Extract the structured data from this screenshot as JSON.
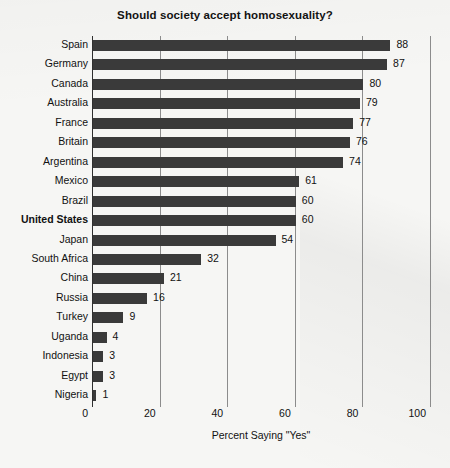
{
  "chart_data": {
    "type": "bar",
    "orientation": "horizontal",
    "title": "Should society accept homosexuality?",
    "xlabel": "Percent Saying \"Yes\"",
    "ylabel": "",
    "xlim": [
      0,
      100
    ],
    "xticks": [
      0,
      20,
      40,
      60,
      80,
      100
    ],
    "grid": "vertical",
    "legend": "none",
    "highlighted_category": "United States",
    "categories": [
      "Spain",
      "Germany",
      "Canada",
      "Australia",
      "France",
      "Britain",
      "Argentina",
      "Mexico",
      "Brazil",
      "United States",
      "Japan",
      "South Africa",
      "China",
      "Russia",
      "Turkey",
      "Uganda",
      "Indonesia",
      "Egypt",
      "Nigeria"
    ],
    "values": [
      88,
      87,
      80,
      79,
      77,
      76,
      74,
      61,
      60,
      60,
      54,
      32,
      21,
      16,
      9,
      4,
      3,
      3,
      1
    ],
    "bar_color": "#3a3a3a",
    "background_color": "#f6f6f4",
    "rows": [
      {
        "label": "Spain",
        "value": 88,
        "bold": false
      },
      {
        "label": "Germany",
        "value": 87,
        "bold": false
      },
      {
        "label": "Canada",
        "value": 80,
        "bold": false
      },
      {
        "label": "Australia",
        "value": 79,
        "bold": false
      },
      {
        "label": "France",
        "value": 77,
        "bold": false
      },
      {
        "label": "Britain",
        "value": 76,
        "bold": false
      },
      {
        "label": "Argentina",
        "value": 74,
        "bold": false
      },
      {
        "label": "Mexico",
        "value": 61,
        "bold": false
      },
      {
        "label": "Brazil",
        "value": 60,
        "bold": false
      },
      {
        "label": "United States",
        "value": 60,
        "bold": true
      },
      {
        "label": "Japan",
        "value": 54,
        "bold": false
      },
      {
        "label": "South Africa",
        "value": 32,
        "bold": false
      },
      {
        "label": "China",
        "value": 21,
        "bold": false
      },
      {
        "label": "Russia",
        "value": 16,
        "bold": false
      },
      {
        "label": "Turkey",
        "value": 9,
        "bold": false
      },
      {
        "label": "Uganda",
        "value": 4,
        "bold": false
      },
      {
        "label": "Indonesia",
        "value": 3,
        "bold": false
      },
      {
        "label": "Egypt",
        "value": 3,
        "bold": false
      },
      {
        "label": "Nigeria",
        "value": 1,
        "bold": false
      }
    ]
  }
}
